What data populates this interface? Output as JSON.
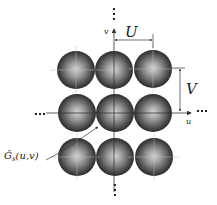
{
  "diagram": {
    "axes": {
      "horizontal_label": "u",
      "vertical_label": "v",
      "continuation": "..."
    },
    "dimensions": {
      "horizontal_period": "U",
      "vertical_period": "V"
    },
    "annotation": {
      "function_label": "Ĝ",
      "function_subscript": "s",
      "function_args": "(u,v)"
    },
    "grid": {
      "rows": 3,
      "cols": 3
    },
    "colors": {
      "sphere_dark": "#1a1a1a",
      "sphere_light": "#d9d9d9",
      "line": "#333333"
    }
  }
}
